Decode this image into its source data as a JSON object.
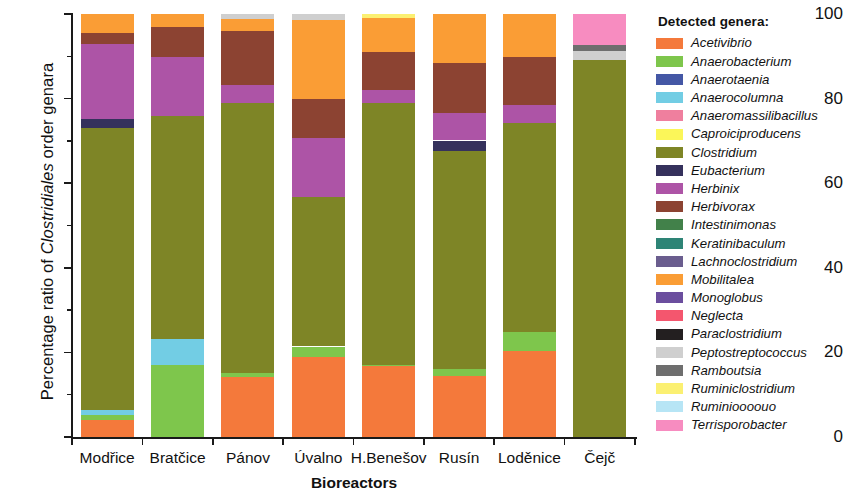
{
  "chart_data": {
    "type": "bar",
    "title": "",
    "subtitle": "",
    "stacked": true,
    "xlabel": "Bioreactors",
    "ylabel_prefix": "Percentage ratio of ",
    "ylabel_italic": "Clostridiales",
    "ylabel_suffix": " order genara",
    "ylabel_full": "Percentage ratio of Clostridiales order genara",
    "ylim": [
      0,
      100
    ],
    "yticks": [
      0,
      20,
      40,
      60,
      80,
      100
    ],
    "yticks_minor": [
      10,
      30,
      50,
      70,
      90
    ],
    "ytick_labels": [
      "0",
      "20",
      "40",
      "60",
      "80",
      "100"
    ],
    "grid": false,
    "legend_position": "right",
    "legend_title": "Detected genera:",
    "categories": [
      "Modřice",
      "Bratčice",
      "Pánov",
      "Úvalno",
      "H.Benešov",
      "Rusín",
      "Loděnice",
      "Čejč"
    ],
    "series": [
      {
        "name": "Acetivibrio",
        "color": "#f4793b",
        "values": [
          4.0,
          0.0,
          14.2,
          19.0,
          16.8,
          14.4,
          20.4,
          0.0
        ]
      },
      {
        "name": "Anaerobacterium",
        "color": "#7ec64c",
        "values": [
          1.1,
          17.0,
          0.9,
          2.4,
          0.3,
          1.6,
          4.5,
          0.0
        ]
      },
      {
        "name": "Anaerotaenia",
        "color": "#4457a5",
        "values": [
          0.0,
          0.0,
          0.0,
          0.0,
          0.0,
          0.0,
          0.0,
          0.0
        ]
      },
      {
        "name": "Anaerocolumna",
        "color": "#72cde4",
        "values": [
          1.4,
          6.1,
          0.0,
          0.0,
          0.0,
          0.0,
          0.0,
          0.0
        ]
      },
      {
        "name": "Anaeromassilibacillus",
        "color": "#ef7f9e",
        "values": [
          0.0,
          0.0,
          0.0,
          0.0,
          0.0,
          0.0,
          0.0,
          0.0
        ]
      },
      {
        "name": "Caproiciproducens",
        "color": "#fbf659",
        "values": [
          0.0,
          0.0,
          0.0,
          0.0,
          0.0,
          0.0,
          0.0,
          0.0
        ]
      },
      {
        "name": "Clostridium",
        "color": "#7e8526",
        "values": [
          66.5,
          52.9,
          63.8,
          35.4,
          61.9,
          51.7,
          49.4,
          89.2
        ]
      },
      {
        "name": "Eubacterium",
        "color": "#35315c",
        "values": [
          2.1,
          0.0,
          0.0,
          0.0,
          0.0,
          2.4,
          0.0,
          0.0
        ]
      },
      {
        "name": "Herbinix",
        "color": "#ad54a6",
        "values": [
          17.9,
          13.8,
          4.4,
          14.0,
          3.1,
          6.4,
          4.1,
          0.0
        ]
      },
      {
        "name": "Herbivorax",
        "color": "#8c4332",
        "values": [
          2.6,
          7.1,
          12.6,
          9.0,
          9.0,
          12.0,
          11.5,
          0.0
        ]
      },
      {
        "name": "Intestinimonas",
        "color": "#42814a",
        "values": [
          0.0,
          0.0,
          0.0,
          0.0,
          0.0,
          0.0,
          0.0,
          0.0
        ]
      },
      {
        "name": "Keratinibaculum",
        "color": "#2e8476",
        "values": [
          0.0,
          0.0,
          0.0,
          0.0,
          0.0,
          0.0,
          0.0,
          0.0
        ]
      },
      {
        "name": "Lachnoclostridium",
        "color": "#6a5d8e",
        "values": [
          0.0,
          0.0,
          0.0,
          0.0,
          0.0,
          0.0,
          0.0,
          0.0
        ]
      },
      {
        "name": "Mobilitalea",
        "color": "#fa9d35",
        "values": [
          4.4,
          3.1,
          3.0,
          18.9,
          7.9,
          11.5,
          10.1,
          0.0
        ]
      },
      {
        "name": "Monoglobus",
        "color": "#6b4e9e",
        "values": [
          0.0,
          0.0,
          0.0,
          0.0,
          0.0,
          0.0,
          0.0,
          0.0
        ]
      },
      {
        "name": "Neglecta",
        "color": "#f4566e",
        "values": [
          0.0,
          0.0,
          0.0,
          0.0,
          0.0,
          0.0,
          0.0,
          0.0
        ]
      },
      {
        "name": "Paraclostridium",
        "color": "#231f20",
        "values": [
          0.0,
          0.0,
          0.0,
          0.0,
          0.0,
          0.0,
          0.0,
          0.0
        ]
      },
      {
        "name": "Peptostreptococcus",
        "color": "#cfcfcf",
        "values": [
          0.0,
          0.0,
          1.1,
          1.3,
          0.0,
          0.0,
          0.0,
          2.1
        ]
      },
      {
        "name": "Ramboutsia",
        "color": "#6e6e6e",
        "values": [
          0.0,
          0.0,
          0.0,
          0.0,
          0.0,
          0.0,
          0.0,
          1.4
        ]
      },
      {
        "name": "Ruminiclostridium",
        "color": "#fbf072",
        "values": [
          0.0,
          0.0,
          0.0,
          0.0,
          1.0,
          0.0,
          0.0,
          0.0
        ]
      },
      {
        "name": "Ruminioooouo",
        "color": "#b7e5f5",
        "values": [
          0.0,
          0.0,
          0.0,
          0.0,
          0.0,
          0.0,
          0.0,
          0.0
        ]
      },
      {
        "name": "Terrisporobacter",
        "color": "#f78cc0",
        "values": [
          0.0,
          0.0,
          0.0,
          0.0,
          0.0,
          0.0,
          0.0,
          7.3
        ]
      }
    ]
  }
}
